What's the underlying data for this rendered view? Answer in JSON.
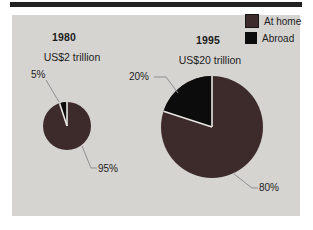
{
  "figure": {
    "description_colors": {
      "at_home": "#3d2b2b",
      "abroad": "#0c0c0c",
      "panel_bg": "#d6d4d1",
      "top_rule": "#222222",
      "leader_line": "#8f8f8f",
      "slice_separator": "#e8e7e4"
    }
  },
  "legend": {
    "items": [
      {
        "label": "At home",
        "color": "#3d2b2b"
      },
      {
        "label": "Abroad",
        "color": "#0c0c0c"
      }
    ]
  },
  "chart_data": [
    {
      "type": "pie",
      "title": "1980",
      "subtitle": "US$2 trillion",
      "total": "US$2 trillion",
      "slices": [
        {
          "label": "At home",
          "value_pct": 95,
          "pct_label": "95%",
          "color": "#3d2b2b"
        },
        {
          "label": "Abroad",
          "value_pct": 5,
          "pct_label": "5%",
          "color": "#0c0c0c"
        }
      ]
    },
    {
      "type": "pie",
      "title": "1995",
      "subtitle": "US$20 trillion",
      "total": "US$20 trillion",
      "slices": [
        {
          "label": "At home",
          "value_pct": 80,
          "pct_label": "80%",
          "color": "#3d2b2b"
        },
        {
          "label": "Abroad",
          "value_pct": 20,
          "pct_label": "20%",
          "color": "#0c0c0c"
        }
      ]
    }
  ]
}
